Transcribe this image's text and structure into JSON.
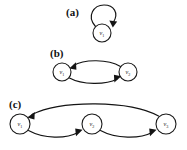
{
  "figure": {
    "background_color": "#ffffff",
    "stroke_color": "#141414",
    "node_fill": "#ffffff",
    "panels": [
      {
        "id": "a",
        "label": "(a)",
        "description": "self-loop on a single vertex",
        "nodes": [
          {
            "id": "v1",
            "label": "v",
            "subscript": "1",
            "cx": 102,
            "cy": 33,
            "r": 9
          }
        ],
        "edges": [
          {
            "from": "v1",
            "to": "v1",
            "type": "self-loop",
            "direction": "clockwise"
          }
        ]
      },
      {
        "id": "b",
        "label": "(b)",
        "description": "two vertices joined by a pair of opposite arcs",
        "nodes": [
          {
            "id": "v1",
            "label": "v",
            "subscript": "1",
            "cx": 62,
            "cy": 72,
            "r": 9
          },
          {
            "id": "v2",
            "label": "v",
            "subscript": "2",
            "cx": 128,
            "cy": 72,
            "r": 9
          }
        ],
        "edges": [
          {
            "from": "v2",
            "to": "v1",
            "type": "arc",
            "side": "top"
          },
          {
            "from": "v1",
            "to": "v2",
            "type": "arc",
            "side": "bottom"
          }
        ]
      },
      {
        "id": "c",
        "label": "(c)",
        "description": "three vertices forming a directed cycle",
        "nodes": [
          {
            "id": "v1",
            "label": "v",
            "subscript": "1",
            "cx": 20,
            "cy": 124,
            "r": 10
          },
          {
            "id": "v2",
            "label": "v",
            "subscript": "2",
            "cx": 92,
            "cy": 124,
            "r": 10
          },
          {
            "id": "v3",
            "label": "v",
            "subscript": "3",
            "cx": 166,
            "cy": 124,
            "r": 10
          }
        ],
        "edges": [
          {
            "from": "v1",
            "to": "v2",
            "type": "arc",
            "side": "bottom"
          },
          {
            "from": "v2",
            "to": "v3",
            "type": "arc",
            "side": "bottom"
          },
          {
            "from": "v3",
            "to": "v1",
            "type": "arc",
            "side": "top"
          }
        ]
      }
    ]
  }
}
